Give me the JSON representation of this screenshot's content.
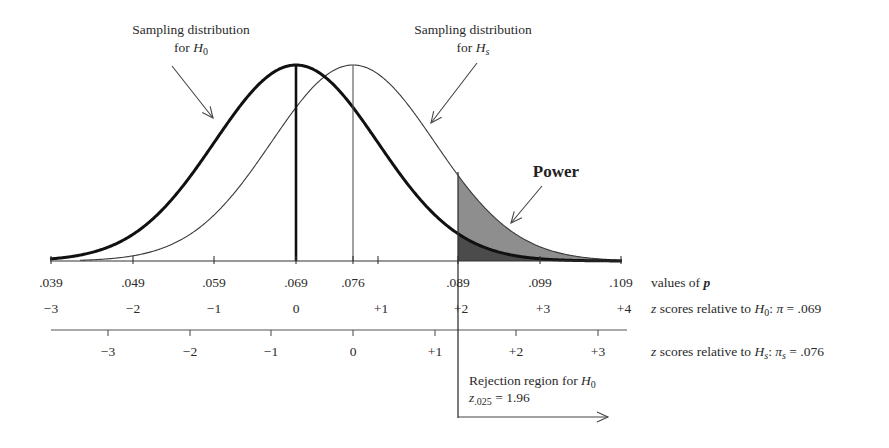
{
  "chart_data": {
    "type": "area",
    "title": "",
    "distributions": [
      {
        "name": "Sampling distribution for H0",
        "mean_p": 0.069,
        "sd_p": 0.01,
        "stroke": "heavy"
      },
      {
        "name": "Sampling distribution for Hs",
        "mean_p": 0.076,
        "sd_p": 0.01,
        "stroke": "thin"
      }
    ],
    "critical_value_p": 0.089,
    "axes": [
      {
        "name": "values of p",
        "ticks": [
          ".039",
          ".049",
          ".059",
          ".069",
          ".076",
          ".089",
          ".099",
          ".109"
        ]
      },
      {
        "name": "z scores relative to H0: π = .069",
        "ticks": [
          "−3",
          "−2",
          "−1",
          "0",
          "+1",
          "+2",
          "+3",
          "+4"
        ]
      },
      {
        "name": "z scores relative to Hs: πs = .076",
        "ticks": [
          "−3",
          "−2",
          "−1",
          "0",
          "+1",
          "+2",
          "+3"
        ]
      }
    ],
    "shaded_regions": [
      {
        "name": "Power",
        "from_p": 0.089,
        "under": "Hs",
        "color": "#8c8c8c"
      },
      {
        "name": "alpha (rejection region for H0)",
        "from_p": 0.089,
        "under": "H0",
        "color": "#4a4a4a"
      }
    ],
    "annotations": [
      "Sampling distribution for H0",
      "Sampling distribution for Hs",
      "Power",
      "Rejection region for H0",
      "z.025 = 1.96"
    ]
  },
  "labels": {
    "h0_line1": "Sampling distribution",
    "h0_line2_prefix": "for ",
    "h0_sym": "H",
    "h0_sub": "0",
    "hs_line1": "Sampling distribution",
    "hs_line2_prefix": "for ",
    "hs_sym": "H",
    "hs_sub": "s",
    "power": "Power",
    "rej_line1_prefix": "Rejection region for ",
    "rej_sym": "H",
    "rej_sub": "0",
    "zcrit_sym": "z",
    "zcrit_sub": ".025",
    "zcrit_val": " = 1.96"
  },
  "axis_p": {
    "ticks": [
      ".039",
      ".049",
      ".059",
      ".069",
      ".076",
      ".089",
      ".099",
      ".109"
    ],
    "label_pre": "values of ",
    "label_var": "p"
  },
  "axis_z0": {
    "ticks": [
      "−3",
      "−2",
      "−1",
      "0",
      "+1",
      "+2",
      "+3",
      "+4"
    ],
    "label_z": "z",
    "label_mid": " scores relative to ",
    "label_H": "H",
    "label_sub": "0",
    "label_rest": ": ",
    "label_pi": "π",
    "label_val": " = .069"
  },
  "axis_zs": {
    "ticks": [
      "−3",
      "−2",
      "−1",
      "0",
      "+1",
      "+2",
      "+3"
    ],
    "label_z": "z",
    "label_mid": " scores relative to ",
    "label_H": "H",
    "label_sub": "s",
    "label_rest": ": ",
    "label_pi": "π",
    "label_pisub": "s",
    "label_val": " = .076"
  },
  "colors": {
    "power_fill": "#8e8e8e",
    "alpha_fill": "#4b4b4b",
    "ink": "#1e1e1e"
  }
}
